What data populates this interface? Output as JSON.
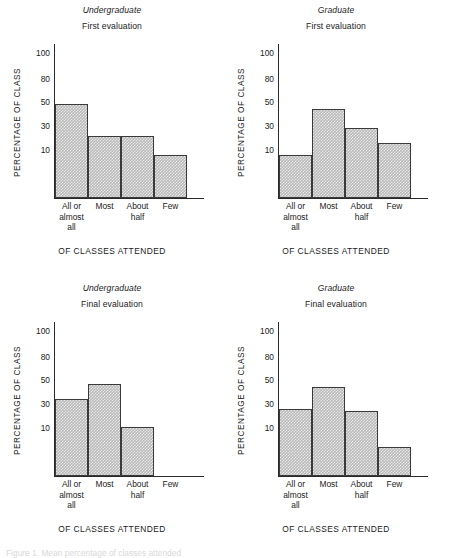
{
  "figure": {
    "caption": "Figure 1. Mean percentage of classes attended",
    "axis": {
      "y_label": "PERCENTAGE OF CLASS",
      "x_label": "OF CLASSES ATTENDED",
      "y_ticks": [
        "100",
        "80",
        "50",
        "30",
        "10"
      ],
      "categories": [
        [
          "All or",
          "almost",
          "all"
        ],
        [
          "Most"
        ],
        [
          "About",
          "half"
        ],
        [
          "Few"
        ]
      ]
    }
  },
  "panels": [
    {
      "group": "Undergraduate",
      "evaluation": "First evaluation",
      "values": [
        48,
        22,
        22,
        9
      ]
    },
    {
      "group": "Graduate",
      "evaluation": "First evaluation",
      "values": [
        9,
        44,
        28,
        16
      ]
    },
    {
      "group": "Undergraduate",
      "evaluation": "Final evaluation",
      "values": [
        34,
        47,
        11,
        0
      ]
    },
    {
      "group": "Graduate",
      "evaluation": "Final evaluation",
      "values": [
        26,
        44,
        24,
        6
      ]
    }
  ],
  "chart_data": {
    "type": "bar",
    "xlabel": "OF CLASSES ATTENDED",
    "ylabel": "PERCENTAGE OF CLASS",
    "categories": [
      "All or almost all",
      "Most",
      "About half",
      "Few"
    ],
    "y_ticks": [
      10,
      30,
      50,
      80,
      100
    ],
    "ylim": [
      0,
      100
    ],
    "grid": false,
    "legend": "none",
    "panel_layout": "2x2",
    "series": [
      {
        "name": "Undergraduate — First evaluation",
        "values": [
          48,
          22,
          22,
          9
        ]
      },
      {
        "name": "Graduate — First evaluation",
        "values": [
          9,
          44,
          28,
          16
        ]
      },
      {
        "name": "Undergraduate — Final evaluation",
        "values": [
          34,
          47,
          11,
          0
        ]
      },
      {
        "name": "Graduate — Final evaluation",
        "values": [
          26,
          44,
          24,
          6
        ]
      }
    ]
  }
}
